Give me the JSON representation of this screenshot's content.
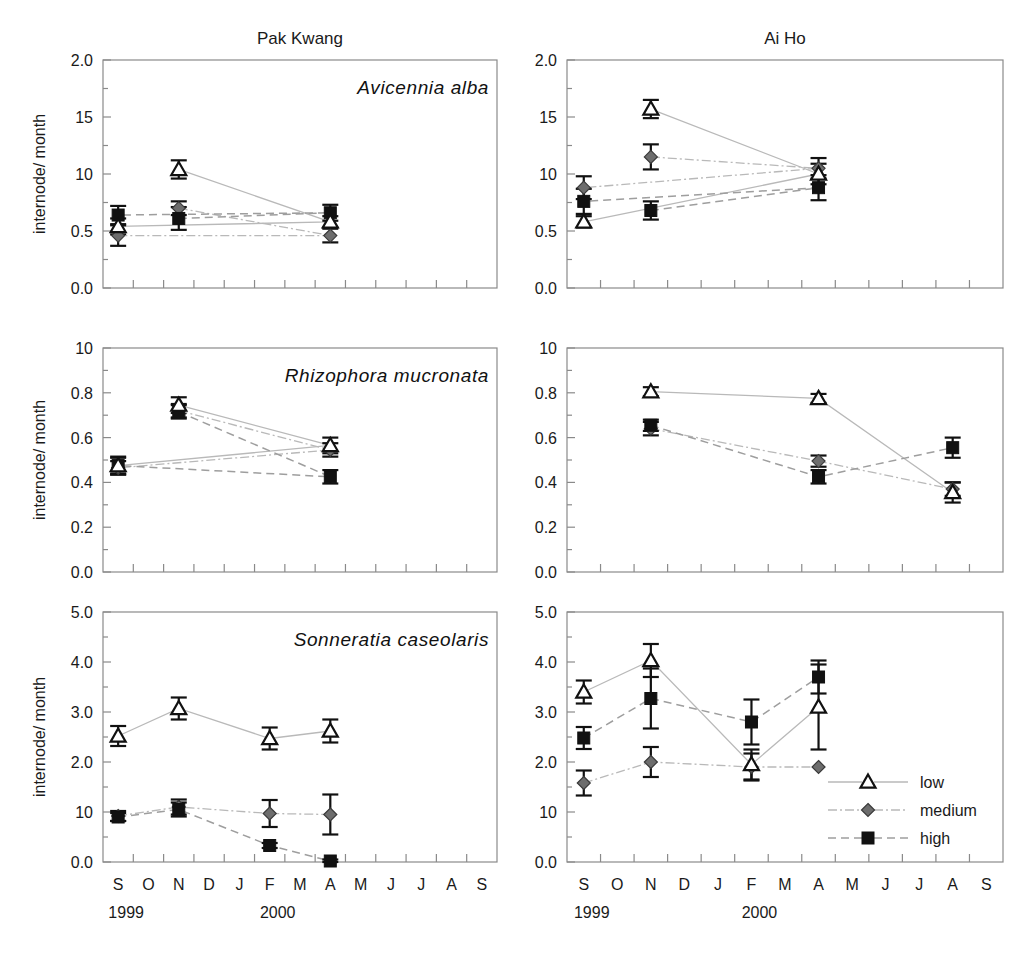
{
  "figure": {
    "column_titles": [
      "Pak Kwang",
      "Ai Ho"
    ],
    "y_axis_label": "internode/ month",
    "x_categories": [
      "S",
      "O",
      "N",
      "D",
      "J",
      "F",
      "M",
      "A",
      "M",
      "J",
      "J",
      "A",
      "S"
    ],
    "year_labels": [
      {
        "text": "1999",
        "at_index": 0
      },
      {
        "text": "2000",
        "at_index": 5
      }
    ],
    "colors": {
      "low_marker": "#ffffff",
      "medium_marker": "#6d6d6d",
      "high_marker": "#111111",
      "axis": "#8a8a8a",
      "line": "#b9b9b9",
      "text": "#1a1a1a"
    }
  },
  "legend": {
    "position": "bottom-right panel, inside",
    "entries": [
      {
        "label": "low",
        "marker": "open-triangle",
        "line": "solid"
      },
      {
        "label": "medium",
        "marker": "gray-diamond",
        "line": "dash-dot"
      },
      {
        "label": "high",
        "marker": "filled-square",
        "line": "dashed"
      }
    ]
  },
  "chart_data": [
    {
      "id": "pakkwang-avicennia",
      "type": "line",
      "title": "Pak Kwang",
      "annotation": "Avicennia alba",
      "xlabel": "",
      "ylabel": "internode/ month",
      "x": [
        "S",
        "O",
        "N",
        "D",
        "J",
        "F",
        "M",
        "A",
        "M",
        "J",
        "J",
        "A",
        "S"
      ],
      "ytick_labels": [
        "2.0",
        "15",
        "10",
        "0.5",
        "0.0"
      ],
      "ytick_values": [
        2.0,
        1.5,
        1.0,
        0.5,
        0.0
      ],
      "ylim": [
        0.0,
        2.0
      ],
      "grid": false,
      "series": [
        {
          "name": "low",
          "points": [
            {
              "x": "N",
              "y": 1.04,
              "err": 0.08
            },
            {
              "x": "A",
              "y": 0.58,
              "err": 0.05
            },
            {
              "x": "S",
              "y": 0.54,
              "err": 0.07
            }
          ]
        },
        {
          "name": "medium",
          "points": [
            {
              "x": "N",
              "y": 0.7,
              "err": 0.06
            },
            {
              "x": "A",
              "y": 0.46,
              "err": 0.06
            },
            {
              "x": "S",
              "y": 0.46,
              "err": 0.09
            }
          ]
        },
        {
          "name": "high",
          "points": [
            {
              "x": "N",
              "y": 0.61,
              "err": 0.1
            },
            {
              "x": "A",
              "y": 0.66,
              "err": 0.07
            },
            {
              "x": "S",
              "y": 0.64,
              "err": 0.08
            }
          ]
        }
      ]
    },
    {
      "id": "aiho-avicennia",
      "type": "line",
      "title": "Ai Ho",
      "annotation": "",
      "xlabel": "",
      "ylabel": "",
      "x": [
        "S",
        "O",
        "N",
        "D",
        "J",
        "F",
        "M",
        "A",
        "M",
        "J",
        "J",
        "A",
        "S"
      ],
      "ytick_labels": [
        "2.0",
        "15",
        "10",
        "0.5",
        "0.0"
      ],
      "ytick_values": [
        2.0,
        1.5,
        1.0,
        0.5,
        0.0
      ],
      "ylim": [
        0.0,
        2.0
      ],
      "grid": false,
      "series": [
        {
          "name": "low",
          "points": [
            {
              "x": "N",
              "y": 1.57,
              "err": 0.08
            },
            {
              "x": "A",
              "y": 1.0,
              "err": 0.09
            },
            {
              "x": "S",
              "y": 0.58,
              "err": 0.05
            }
          ]
        },
        {
          "name": "medium",
          "points": [
            {
              "x": "N",
              "y": 1.15,
              "err": 0.11
            },
            {
              "x": "A",
              "y": 1.05,
              "err": 0.09
            },
            {
              "x": "S",
              "y": 0.88,
              "err": 0.1
            }
          ]
        },
        {
          "name": "high",
          "points": [
            {
              "x": "N",
              "y": 0.68,
              "err": 0.08
            },
            {
              "x": "A",
              "y": 0.88,
              "err": 0.11
            },
            {
              "x": "S",
              "y": 0.76,
              "err": 0.11
            }
          ]
        }
      ]
    },
    {
      "id": "pakkwang-rhizophora",
      "type": "line",
      "title": "",
      "annotation": "Rhizophora mucronata",
      "xlabel": "",
      "ylabel": "internode/ month",
      "x": [
        "S",
        "O",
        "N",
        "D",
        "J",
        "F",
        "M",
        "A",
        "M",
        "J",
        "J",
        "A",
        "S"
      ],
      "ytick_labels": [
        "10",
        "0.8",
        "0.6",
        "0.4",
        "0.2",
        "0.0"
      ],
      "ytick_values": [
        1.0,
        0.8,
        0.6,
        0.4,
        0.2,
        0.0
      ],
      "ylim": [
        0.0,
        1.0
      ],
      "grid": false,
      "series": [
        {
          "name": "low",
          "points": [
            {
              "x": "N",
              "y": 0.745,
              "err": 0.035
            },
            {
              "x": "A",
              "y": 0.565,
              "err": 0.035
            },
            {
              "x": "S",
              "y": 0.475,
              "err": 0.035
            }
          ]
        },
        {
          "name": "medium",
          "points": [
            {
              "x": "N",
              "y": 0.72,
              "err": 0.03
            },
            {
              "x": "A",
              "y": 0.545,
              "err": 0.03
            },
            {
              "x": "S",
              "y": 0.465,
              "err": 0.03
            }
          ]
        },
        {
          "name": "high",
          "points": [
            {
              "x": "N",
              "y": 0.715,
              "err": 0.03
            },
            {
              "x": "A",
              "y": 0.425,
              "err": 0.03
            },
            {
              "x": "S",
              "y": 0.475,
              "err": 0.04
            }
          ]
        }
      ]
    },
    {
      "id": "aiho-rhizophora",
      "type": "line",
      "title": "",
      "annotation": "",
      "xlabel": "",
      "ylabel": "",
      "x": [
        "S",
        "O",
        "N",
        "D",
        "J",
        "F",
        "M",
        "A",
        "M",
        "J",
        "J",
        "A",
        "S"
      ],
      "ytick_labels": [
        "10",
        "0.8",
        "0.6",
        "0.4",
        "0.2",
        "0.0"
      ],
      "ytick_values": [
        1.0,
        0.8,
        0.6,
        0.4,
        0.2,
        0.0
      ],
      "ylim": [
        0.0,
        1.0
      ],
      "grid": false,
      "series": [
        {
          "name": "low",
          "points": [
            {
              "x": "N",
              "y": 0.805,
              "err": 0.02
            },
            {
              "x": "A",
              "y": 0.775,
              "err": 0.02
            },
            {
              "x": "A2",
              "y": 0.355,
              "err": 0.045
            }
          ]
        },
        {
          "name": "medium",
          "points": [
            {
              "x": "N",
              "y": 0.64,
              "err": 0.03
            },
            {
              "x": "A",
              "y": 0.495,
              "err": 0.025
            },
            {
              "x": "A2",
              "y": 0.37,
              "err": 0.03
            }
          ]
        },
        {
          "name": "high",
          "points": [
            {
              "x": "N",
              "y": 0.655,
              "err": 0.025
            },
            {
              "x": "A",
              "y": 0.425,
              "err": 0.03
            },
            {
              "x": "A2",
              "y": 0.555,
              "err": 0.045
            }
          ]
        }
      ]
    },
    {
      "id": "pakkwang-sonneratia",
      "type": "line",
      "title": "",
      "annotation": "Sonneratia caseolaris",
      "xlabel": "",
      "ylabel": "internode/ month",
      "x": [
        "S",
        "O",
        "N",
        "D",
        "J",
        "F",
        "M",
        "A",
        "M",
        "J",
        "J",
        "A",
        "S"
      ],
      "ytick_labels": [
        "5.0",
        "4.0",
        "3.0",
        "2.0",
        "10",
        "0.0"
      ],
      "ytick_values": [
        5.0,
        4.0,
        3.0,
        2.0,
        1.0,
        0.0
      ],
      "ylim": [
        0.0,
        5.0
      ],
      "grid": false,
      "series": [
        {
          "name": "low",
          "points": [
            {
              "x": "S",
              "y": 2.52,
              "err": 0.2
            },
            {
              "x": "N",
              "y": 3.07,
              "err": 0.22
            },
            {
              "x": "F",
              "y": 2.47,
              "err": 0.22
            },
            {
              "x": "A",
              "y": 2.62,
              "err": 0.23
            }
          ]
        },
        {
          "name": "medium",
          "points": [
            {
              "x": "S",
              "y": 0.92,
              "err": 0.1
            },
            {
              "x": "N",
              "y": 1.1,
              "err": 0.15
            },
            {
              "x": "F",
              "y": 0.97,
              "err": 0.27
            },
            {
              "x": "A",
              "y": 0.95,
              "err": 0.4
            }
          ]
        },
        {
          "name": "high",
          "points": [
            {
              "x": "S",
              "y": 0.9,
              "err": 0.08
            },
            {
              "x": "N",
              "y": 1.05,
              "err": 0.14
            },
            {
              "x": "F",
              "y": 0.33,
              "err": 0.05
            },
            {
              "x": "A",
              "y": 0.02,
              "err": 0.03
            }
          ]
        }
      ]
    },
    {
      "id": "aiho-sonneratia",
      "type": "line",
      "title": "",
      "annotation": "",
      "xlabel": "",
      "ylabel": "",
      "x": [
        "S",
        "O",
        "N",
        "D",
        "J",
        "F",
        "M",
        "A",
        "M",
        "J",
        "J",
        "A",
        "S"
      ],
      "ytick_labels": [
        "5.0",
        "4.0",
        "3.0",
        "2.0",
        "10",
        "0.0"
      ],
      "ytick_values": [
        5.0,
        4.0,
        3.0,
        2.0,
        1.0,
        0.0
      ],
      "ylim": [
        0.0,
        5.0
      ],
      "grid": false,
      "series": [
        {
          "name": "low",
          "points": [
            {
              "x": "S",
              "y": 3.4,
              "err": 0.23
            },
            {
              "x": "N",
              "y": 4.03,
              "err": 0.33
            },
            {
              "x": "F",
              "y": 1.95,
              "err": 0.3
            },
            {
              "x": "A",
              "y": 3.1,
              "err": 0.85
            }
          ]
        },
        {
          "name": "medium",
          "points": [
            {
              "x": "S",
              "y": 1.58,
              "err": 0.25
            },
            {
              "x": "N",
              "y": 2.0,
              "err": 0.3
            },
            {
              "x": "F",
              "y": 1.9,
              "err": 0.27
            },
            {
              "x": "A",
              "y": 1.9,
              "err": 0.0
            }
          ]
        },
        {
          "name": "high",
          "points": [
            {
              "x": "S",
              "y": 2.48,
              "err": 0.22
            },
            {
              "x": "N",
              "y": 3.27,
              "err": 0.6
            },
            {
              "x": "F",
              "y": 2.8,
              "err": 0.45
            },
            {
              "x": "A",
              "y": 3.7,
              "err": 0.33
            }
          ]
        }
      ]
    }
  ]
}
